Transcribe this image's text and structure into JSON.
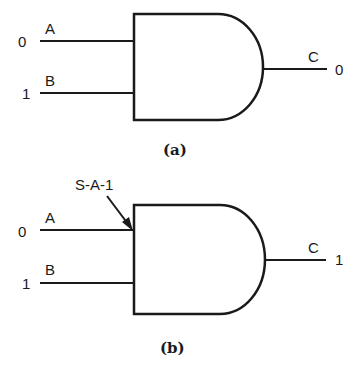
{
  "diagrams": [
    {
      "id": "a",
      "caption": "(a)",
      "gate_type": "AND",
      "inputs": [
        {
          "name": "A",
          "value": "0"
        },
        {
          "name": "B",
          "value": "1"
        }
      ],
      "output": {
        "name": "C",
        "value": "0"
      }
    },
    {
      "id": "b",
      "caption": "(b)",
      "gate_type": "AND",
      "fault_label": "S-A-1",
      "inputs": [
        {
          "name": "A",
          "value": "0"
        },
        {
          "name": "B",
          "value": "1"
        }
      ],
      "output": {
        "name": "C",
        "value": "1"
      }
    }
  ],
  "colors": {
    "stroke": "#1a1a1a",
    "background": "#ffffff"
  }
}
